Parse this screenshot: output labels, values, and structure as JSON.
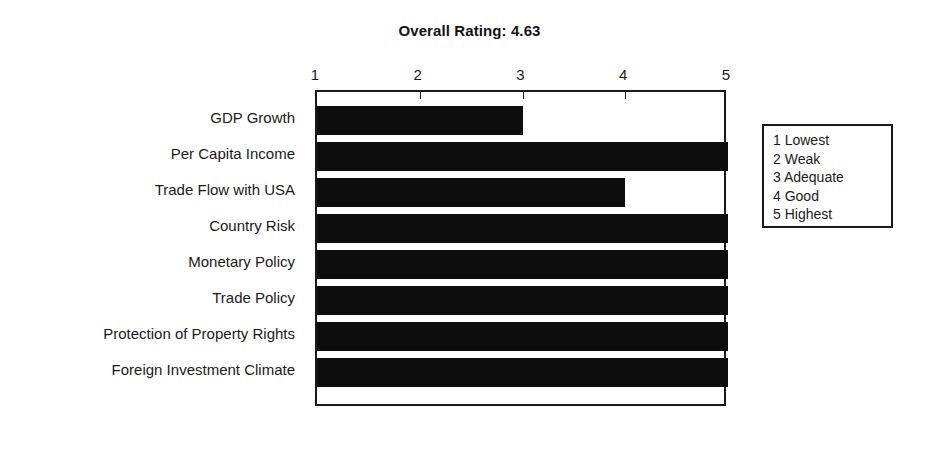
{
  "chart_data": {
    "type": "bar",
    "orientation": "horizontal",
    "title": "Overall Rating: 4.63",
    "xlabel": "",
    "ylabel": "",
    "xlim": [
      1,
      5
    ],
    "grid": false,
    "legend_position": "right-outside",
    "categories": [
      "GDP Growth",
      "Per Capita Income",
      "Trade Flow with USA",
      "Country Risk",
      "Monetary Policy",
      "Trade Policy",
      "Protection of Property Rights",
      "Foreign Investment Climate"
    ],
    "values": [
      3,
      5,
      4,
      5,
      5,
      5,
      5,
      5
    ],
    "tick_labels": [
      "1",
      "2",
      "3",
      "4",
      "5"
    ],
    "tick_values": [
      1,
      2,
      3,
      4,
      5
    ],
    "bar_color": "#0d0d0d",
    "axis_color": "#1a1a1a",
    "background_color": "#ffffff",
    "legend_title": "",
    "legend_entries": [
      "1 Lowest",
      "2 Weak",
      "3 Adequate",
      "4 Good",
      "5 Highest"
    ],
    "annotations": []
  }
}
